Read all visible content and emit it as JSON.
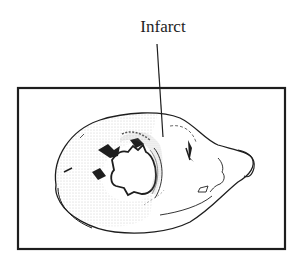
{
  "figure": {
    "label": "Infarct",
    "colors": {
      "ink": "#1e1e1e",
      "stipple": "#9a9a9a",
      "background": "#ffffff"
    }
  }
}
